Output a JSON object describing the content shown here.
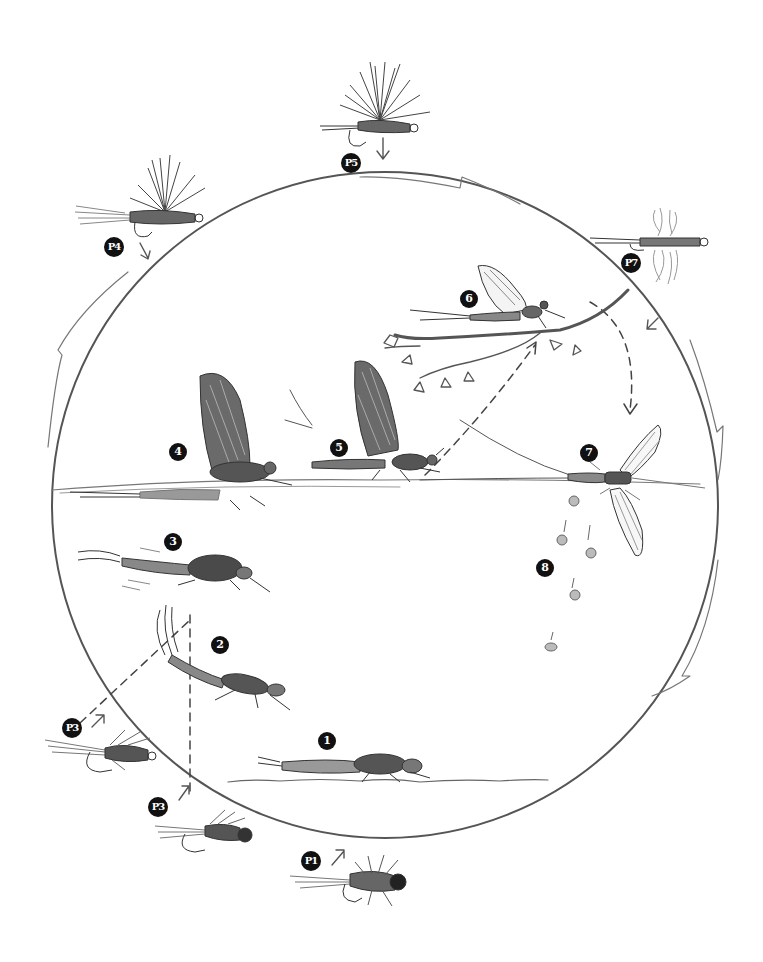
{
  "diagram": {
    "type": "life-cycle",
    "colors": {
      "ink": "#3a3a3a",
      "badge": "#111111",
      "paper": "#ffffff"
    },
    "stages": [
      {
        "id": "1",
        "label": "1",
        "depicts": "nymph crawling on stream bottom"
      },
      {
        "id": "2",
        "label": "2",
        "depicts": "nymph swimming upward"
      },
      {
        "id": "3",
        "label": "3",
        "depicts": "emerging nymph below surface"
      },
      {
        "id": "4",
        "label": "4",
        "depicts": "emerger / dun breaking out of shuck at surface"
      },
      {
        "id": "5",
        "label": "5",
        "depicts": "dun (subimago) on the water"
      },
      {
        "id": "6",
        "label": "6",
        "depicts": "spinner resting on branch"
      },
      {
        "id": "7",
        "label": "7",
        "depicts": "spent spinner on the water"
      },
      {
        "id": "8",
        "label": "8",
        "depicts": "eggs sinking"
      }
    ],
    "patterns": [
      {
        "id": "P1",
        "label": "P1",
        "depicts": "nymph fly pattern (bottom)"
      },
      {
        "id": "P3a",
        "label": "P3",
        "depicts": "soft-hackle emerger pattern (left)"
      },
      {
        "id": "P3b",
        "label": "P3",
        "depicts": "emerger nymph pattern (lower left)"
      },
      {
        "id": "P4",
        "label": "P4",
        "depicts": "dry fly with trailing shuck"
      },
      {
        "id": "P5",
        "label": "P5",
        "depicts": "parachute dry fly"
      },
      {
        "id": "P7",
        "label": "P7",
        "depicts": "spinner pattern with spent wings"
      }
    ]
  }
}
